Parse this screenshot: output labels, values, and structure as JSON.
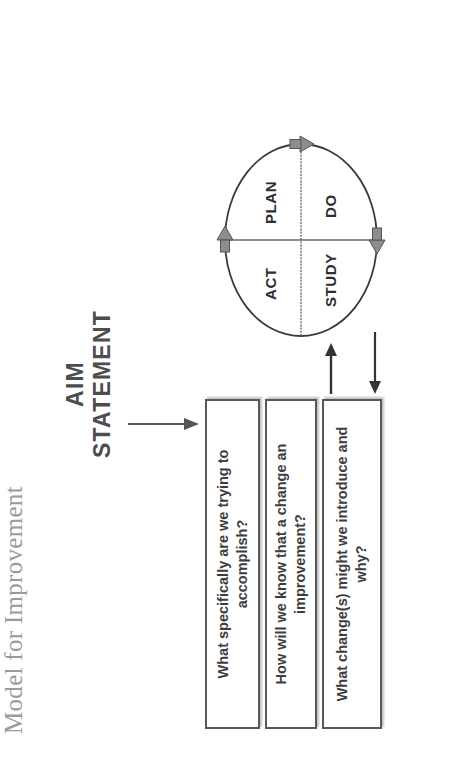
{
  "diagram": {
    "title": "Model for Improvement",
    "orientation": "rotated-90-ccw",
    "aim": {
      "line1": "AIM",
      "line2": "STATEMENT",
      "arrow": "down-arrow-icon"
    },
    "questions": [
      {
        "text": "What specifically are we trying to accomplish?"
      },
      {
        "text": "How will we know that a change an improvement?"
      },
      {
        "text": "What change(s) might we introduce and why?"
      }
    ],
    "connectors": [
      {
        "name": "box-to-cycle",
        "direction": "right"
      },
      {
        "name": "cycle-to-box",
        "direction": "left"
      }
    ],
    "cycle": {
      "name": "PDSA cycle",
      "quadrants": [
        {
          "key": "act",
          "label": "ACT"
        },
        {
          "key": "plan",
          "label": "PLAN"
        },
        {
          "key": "study",
          "label": "STUDY"
        },
        {
          "key": "do",
          "label": "DO"
        }
      ],
      "arrows": [
        {
          "name": "cycle-arrow-top",
          "direction": "clockwise"
        },
        {
          "name": "cycle-arrow-right",
          "direction": "clockwise"
        },
        {
          "name": "cycle-arrow-bottom",
          "direction": "clockwise"
        }
      ]
    },
    "colors": {
      "title": "#9a9a9a",
      "aim_text": "#4d4d4d",
      "box_border": "#585858",
      "box_text": "#3d3d3d",
      "line": "#555555",
      "arrow_fill": "#8d8d8d",
      "background": "#ffffff"
    }
  }
}
